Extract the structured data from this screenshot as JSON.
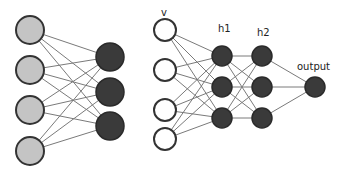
{
  "diagram": {
    "type": "neural-network",
    "left_network": {
      "input_nodes": [
        {
          "x": 30,
          "y": 30,
          "r": 14
        },
        {
          "x": 30,
          "y": 70,
          "r": 14
        },
        {
          "x": 30,
          "y": 110,
          "r": 14
        },
        {
          "x": 30,
          "y": 151,
          "r": 14
        }
      ],
      "output_nodes": [
        {
          "x": 110,
          "y": 57,
          "r": 14
        },
        {
          "x": 110,
          "y": 92,
          "r": 14
        },
        {
          "x": 110,
          "y": 126,
          "r": 14
        }
      ]
    },
    "right_network": {
      "labels": {
        "visible": "v",
        "hidden1": "h1",
        "hidden2": "h2",
        "output": "output"
      },
      "visible_nodes": [
        {
          "x": 165,
          "y": 30,
          "r": 11
        },
        {
          "x": 165,
          "y": 70,
          "r": 11
        },
        {
          "x": 165,
          "y": 110,
          "r": 11
        },
        {
          "x": 165,
          "y": 139,
          "r": 11
        }
      ],
      "h1_nodes": [
        {
          "x": 222,
          "y": 56,
          "r": 10
        },
        {
          "x": 222,
          "y": 87,
          "r": 10
        },
        {
          "x": 222,
          "y": 118,
          "r": 10
        }
      ],
      "h2_nodes": [
        {
          "x": 262,
          "y": 56,
          "r": 10
        },
        {
          "x": 262,
          "y": 87,
          "r": 10
        },
        {
          "x": 262,
          "y": 118,
          "r": 10
        }
      ],
      "output_nodes": [
        {
          "x": 315,
          "y": 87,
          "r": 10
        }
      ]
    }
  }
}
